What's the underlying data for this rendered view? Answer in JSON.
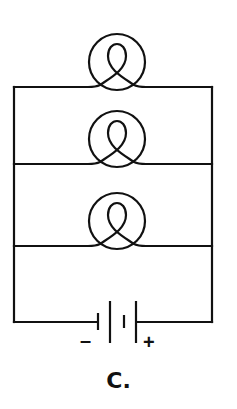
{
  "diagram": {
    "label": "C.",
    "battery": {
      "negative_sign": "–",
      "positive_sign": "+"
    },
    "bulbs": [
      {
        "id": "bulb-1"
      },
      {
        "id": "bulb-2"
      },
      {
        "id": "bulb-3"
      }
    ],
    "colors": {
      "line": "#111111",
      "background": "#ffffff"
    }
  }
}
